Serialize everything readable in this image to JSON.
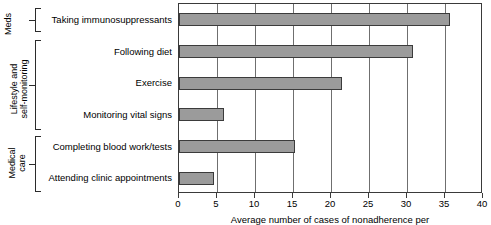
{
  "chart_data": {
    "type": "bar",
    "orientation": "horizontal",
    "title": "",
    "xlabel": "Average number of cases of nonadherence per",
    "ylabel": "",
    "xlim": [
      0,
      40
    ],
    "xticks": [
      0,
      5,
      10,
      15,
      20,
      25,
      30,
      35,
      40
    ],
    "grid": true,
    "legend": "none",
    "bar_color": "#9b9b9b",
    "bar_edge_color": "#3b3b3b",
    "categories": [
      "Taking immunosuppressants",
      "Following diet",
      "Exercise",
      "Monitoring vital signs",
      "Completing blood work/tests",
      "Attending clinic appointments"
    ],
    "values": [
      35.7,
      30.8,
      21.5,
      5.9,
      15.3,
      4.6
    ],
    "groups": [
      {
        "label": "Meds",
        "categories": [
          "Taking immunosuppressants"
        ]
      },
      {
        "label": "Lifestyle and\nself-monitoring",
        "categories": [
          "Following diet",
          "Exercise",
          "Monitoring vital signs"
        ]
      },
      {
        "label": "Medical\ncare",
        "categories": [
          "Completing blood work/tests",
          "Attending clinic appointments"
        ]
      }
    ]
  }
}
